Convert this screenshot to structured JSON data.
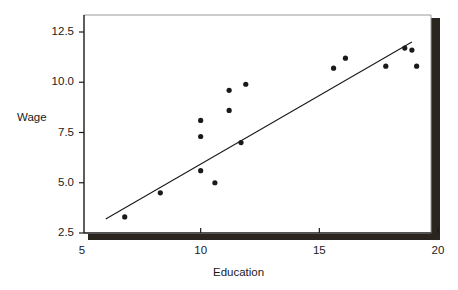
{
  "chart_data": {
    "type": "scatter",
    "title": "",
    "xlabel": "Education",
    "ylabel": "Wage",
    "xlim": [
      5,
      20
    ],
    "ylim": [
      2.5,
      13.1
    ],
    "grid": false,
    "legend": null,
    "xticks": [
      5,
      10,
      15,
      20
    ],
    "xtick_labels": [
      "5",
      "10",
      "15",
      "20"
    ],
    "yticks": [
      2.5,
      5.0,
      7.5,
      10.0,
      12.5
    ],
    "ytick_labels": [
      "2.5",
      "5.0",
      "7.5",
      "10.0",
      "12.5"
    ],
    "marker": "filled-circle",
    "marker_color": "#1a1a1a",
    "points": [
      {
        "x": 6.8,
        "y": 3.3
      },
      {
        "x": 8.3,
        "y": 4.5
      },
      {
        "x": 10.0,
        "y": 5.6
      },
      {
        "x": 10.0,
        "y": 7.3
      },
      {
        "x": 10.0,
        "y": 8.1
      },
      {
        "x": 10.6,
        "y": 5.0
      },
      {
        "x": 11.2,
        "y": 8.6
      },
      {
        "x": 11.2,
        "y": 9.6
      },
      {
        "x": 11.7,
        "y": 7.0
      },
      {
        "x": 11.9,
        "y": 9.9
      },
      {
        "x": 15.6,
        "y": 10.7
      },
      {
        "x": 16.1,
        "y": 11.2
      },
      {
        "x": 17.8,
        "y": 10.8
      },
      {
        "x": 18.6,
        "y": 11.7
      },
      {
        "x": 18.9,
        "y": 11.6
      },
      {
        "x": 19.1,
        "y": 10.8
      }
    ],
    "fit_line": {
      "name": "regression-line",
      "color": "#1a1a1a",
      "x_start": 6.0,
      "y_start": 3.2,
      "x_end": 18.9,
      "y_end": 12.0
    }
  },
  "frame": {
    "border_color": "#8a8a8a",
    "axis_color": "#1a1a1a",
    "shadow_color": "#2b2520"
  }
}
